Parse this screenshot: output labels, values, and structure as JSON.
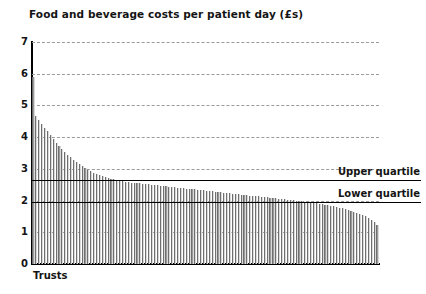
{
  "chart_data": {
    "type": "bar",
    "title": "Food and beverage costs per patient day (£s)",
    "xlabel": "Trusts",
    "ylabel": "",
    "ylim": [
      0,
      7
    ],
    "yticks": [
      0,
      1,
      2,
      3,
      4,
      5,
      6,
      7
    ],
    "ytick_labels": [
      "0",
      "1",
      "2",
      "3",
      "4",
      "5",
      "6",
      "7"
    ],
    "grid": "horizontal-dashed",
    "legend": "none",
    "bar_color": "#9b9b9b",
    "line_color": "#000000",
    "categories_label": "Trusts (sorted descending, n=120)",
    "annotations": [
      {
        "label": "Upper quartile",
        "value": 2.65,
        "style": "solid-black-line"
      },
      {
        "label": "Lower quartile",
        "value": 1.95,
        "style": "solid-black-line"
      }
    ],
    "values": [
      5.9,
      4.66,
      4.55,
      4.42,
      4.3,
      4.18,
      4.06,
      3.94,
      3.83,
      3.72,
      3.62,
      3.53,
      3.44,
      3.36,
      3.28,
      3.21,
      3.14,
      3.08,
      3.02,
      2.97,
      2.92,
      2.88,
      2.84,
      2.8,
      2.77,
      2.74,
      2.71,
      2.69,
      2.67,
      2.65,
      2.63,
      2.61,
      2.6,
      2.58,
      2.57,
      2.56,
      2.55,
      2.54,
      2.53,
      2.52,
      2.51,
      2.5,
      2.49,
      2.48,
      2.47,
      2.46,
      2.45,
      2.44,
      2.43,
      2.42,
      2.41,
      2.4,
      2.39,
      2.38,
      2.37,
      2.36,
      2.35,
      2.34,
      2.33,
      2.32,
      2.31,
      2.3,
      2.29,
      2.28,
      2.27,
      2.26,
      2.25,
      2.24,
      2.23,
      2.22,
      2.21,
      2.2,
      2.19,
      2.18,
      2.17,
      2.16,
      2.15,
      2.14,
      2.13,
      2.12,
      2.11,
      2.1,
      2.09,
      2.08,
      2.07,
      2.06,
      2.05,
      2.04,
      2.03,
      2.02,
      2.01,
      2.0,
      1.99,
      1.98,
      1.97,
      1.96,
      1.95,
      1.93,
      1.92,
      1.9,
      1.89,
      1.87,
      1.85,
      1.84,
      1.82,
      1.8,
      1.78,
      1.76,
      1.74,
      1.71,
      1.68,
      1.65,
      1.62,
      1.58,
      1.54,
      1.5,
      1.45,
      1.39,
      1.32,
      1.22
    ]
  },
  "labels": {
    "upper_quartile": "Upper quartile",
    "lower_quartile": "Lower quartile",
    "trusts": "Trusts"
  }
}
